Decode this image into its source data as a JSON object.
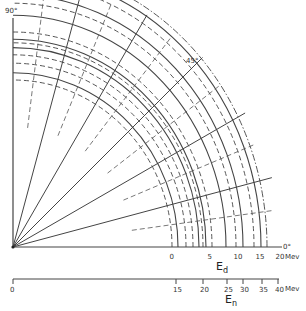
{
  "labels": {
    "angle_90": "90°",
    "angle_45": "45°",
    "angle_0": "0°"
  },
  "ed_axis": {
    "title_main": "E",
    "title_sub": "d",
    "unit": "Mev",
    "ticks": [
      {
        "label": "0",
        "value": 0
      },
      {
        "label": "5",
        "value": 5
      },
      {
        "label": "10",
        "value": 10
      },
      {
        "label": "15",
        "value": 15
      },
      {
        "label": "20",
        "value": 20
      }
    ]
  },
  "en_axis": {
    "title_main": "E",
    "title_sub": "n",
    "unit": "Mev",
    "ticks": [
      {
        "label": "0",
        "value": 0
      },
      {
        "label": "15",
        "value": 15
      },
      {
        "label": "20",
        "value": 20
      },
      {
        "label": "25",
        "value": 25
      },
      {
        "label": "30",
        "value": 30
      },
      {
        "label": "35",
        "value": 35
      },
      {
        "label": "40",
        "value": 40
      }
    ]
  },
  "radial_lines": {
    "solid_angles_deg": [
      0,
      15,
      30,
      45,
      60,
      75,
      90
    ],
    "dashed_angles_deg": [
      8,
      23,
      38,
      53,
      68,
      83
    ]
  },
  "arcs": [
    {
      "style": "dash",
      "rel": 0.0
    },
    {
      "style": "solid",
      "rel": 0.06
    },
    {
      "style": "dash",
      "rel": 0.14
    },
    {
      "style": "dash",
      "rel": 0.21
    },
    {
      "style": "solid",
      "rel": 0.27
    },
    {
      "style": "dash",
      "rel": 0.31
    },
    {
      "style": "solid",
      "rel": 0.34
    },
    {
      "style": "dash",
      "rel": 0.4
    },
    {
      "style": "solid",
      "rel": 0.54
    },
    {
      "style": "dash",
      "rel": 0.64
    },
    {
      "style": "solid",
      "rel": 0.71
    },
    {
      "style": "dash",
      "rel": 0.82
    },
    {
      "style": "solid",
      "rel": 0.89
    },
    {
      "style": "dashdot",
      "rel": 0.95
    }
  ]
}
